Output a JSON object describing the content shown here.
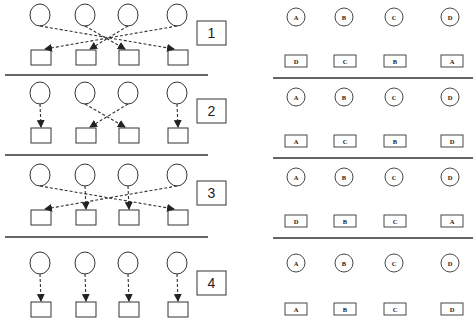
{
  "left_panel": {
    "rows": [
      {
        "number": "1",
        "mapping": [
          4,
          3,
          2,
          1
        ],
        "y": 0
      },
      {
        "number": "2",
        "mapping": [
          1,
          3,
          2,
          4
        ],
        "y": 80
      },
      {
        "number": "3",
        "mapping": [
          4,
          2,
          3,
          1
        ],
        "y": 160
      },
      {
        "number": "4",
        "mapping": [
          1,
          2,
          3,
          4
        ],
        "y": 240
      }
    ]
  },
  "right_panel": {
    "rows": [
      {
        "circles": [
          "A",
          "B",
          "C",
          "D"
        ],
        "boxes": [
          "D",
          "C",
          "B",
          "A"
        ]
      },
      {
        "circles": [
          "A",
          "B",
          "C",
          "D"
        ],
        "boxes": [
          "A",
          "C",
          "B",
          "D"
        ]
      },
      {
        "circles": [
          "A",
          "B",
          "C",
          "D"
        ],
        "boxes": [
          "D",
          "B",
          "C",
          "A"
        ]
      },
      {
        "circles": [
          "A",
          "B",
          "C",
          "D"
        ],
        "boxes": [
          "A",
          "B",
          "C",
          "D"
        ]
      }
    ]
  },
  "colors": {
    "stroke": "#333333",
    "background": "#ffffff"
  }
}
